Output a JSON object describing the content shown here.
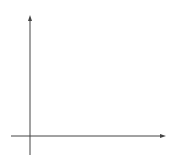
{
  "chart_data": {
    "type": "line",
    "title": "",
    "xlabel": "x",
    "ylabel": "y",
    "xlim": [
      -1,
      7
    ],
    "ylim": [
      -1,
      6
    ],
    "grid": true,
    "tick_labels": {
      "x": [
        "0",
        "1"
      ],
      "y": [
        "1"
      ]
    },
    "series": [
      {
        "name": "f",
        "x": [
          -1,
          0,
          2,
          7
        ],
        "y": [
          1,
          0,
          4,
          2.8
        ]
      },
      {
        "name": "g",
        "x": [
          0,
          2,
          7
        ],
        "y": [
          6,
          0,
          3.3
        ]
      }
    ],
    "annotations": [
      {
        "text": "f",
        "x": 2.1,
        "y": 4.4
      },
      {
        "text": "g",
        "x": 3.6,
        "y": 1.8
      }
    ]
  },
  "labels": {
    "x_axis": "x",
    "y_axis": "y",
    "origin": "0",
    "x_one": "1",
    "y_one": "1",
    "f": "f",
    "g": "g"
  },
  "colors": {
    "grid": "#c8c8c8",
    "line": "#555555",
    "axis": "#444444"
  }
}
